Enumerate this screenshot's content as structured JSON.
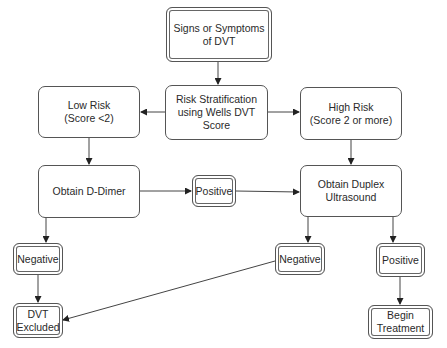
{
  "diagram": {
    "colors": {
      "stroke": "#555555",
      "background": "#ffffff",
      "text": "#2a2a2a"
    },
    "nodes": {
      "start": {
        "label": "Signs or Symptoms\nof DVT",
        "style": "double"
      },
      "risk": {
        "label": "Risk Stratification\nusing Wells DVT\nScore",
        "style": "rounded"
      },
      "low_risk": {
        "label": "Low Risk\n(Score <2)",
        "style": "rounded"
      },
      "high_risk": {
        "label": "High Risk\n(Score 2 or more)",
        "style": "rounded"
      },
      "d_dimer": {
        "label": "Obtain D-Dimer",
        "style": "rounded"
      },
      "d_dimer_positive": {
        "label": "Positive",
        "style": "double"
      },
      "duplex": {
        "label": "Obtain Duplex\nUltrasound",
        "style": "rounded"
      },
      "d_dimer_negative": {
        "label": "Negative",
        "style": "double"
      },
      "dvt_excluded": {
        "label": "DVT\nExcluded",
        "style": "double"
      },
      "duplex_negative": {
        "label": "Negative",
        "style": "double"
      },
      "duplex_positive": {
        "label": "Positive",
        "style": "double"
      },
      "begin_treatment": {
        "label": "Begin\nTreatment",
        "style": "double"
      }
    },
    "edges": [
      {
        "from": "start",
        "to": "risk"
      },
      {
        "from": "risk",
        "to": "low_risk"
      },
      {
        "from": "risk",
        "to": "high_risk"
      },
      {
        "from": "low_risk",
        "to": "d_dimer"
      },
      {
        "from": "high_risk",
        "to": "duplex"
      },
      {
        "from": "d_dimer",
        "to": "d_dimer_positive"
      },
      {
        "from": "d_dimer_positive",
        "to": "duplex"
      },
      {
        "from": "d_dimer",
        "to": "d_dimer_negative"
      },
      {
        "from": "d_dimer_negative",
        "to": "dvt_excluded"
      },
      {
        "from": "duplex",
        "to": "duplex_negative"
      },
      {
        "from": "duplex",
        "to": "duplex_positive"
      },
      {
        "from": "duplex_negative",
        "to": "dvt_excluded"
      },
      {
        "from": "duplex_positive",
        "to": "begin_treatment"
      }
    ]
  }
}
